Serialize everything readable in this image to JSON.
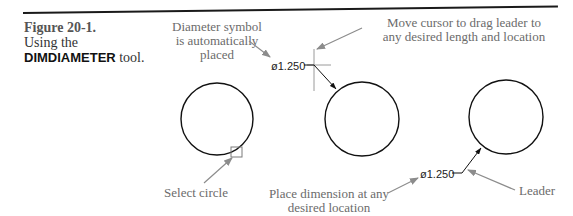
{
  "caption": {
    "figure_label": "Figure 20-1.",
    "line2": "Using the",
    "tool_name": "DIMDIAMETER",
    "tool_suffix": " tool."
  },
  "annotations": {
    "diameter_symbol": [
      "Diameter symbol",
      "is automatically",
      "placed"
    ],
    "move_cursor": [
      "Move cursor to drag leader to",
      "any desired length and location"
    ],
    "select_circle": "Select circle",
    "place_dimension": [
      "Place dimension at any",
      "desired location"
    ],
    "leader": "Leader"
  },
  "dimensions": {
    "first": "ø1.250",
    "second": "ø1.250"
  },
  "colors": {
    "rule": "#1a1a1a",
    "annotation_text": "#6b6b6b",
    "arrow": "#8c8c8c",
    "geometry": "#111111"
  }
}
